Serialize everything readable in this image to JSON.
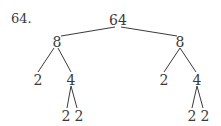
{
  "problem_label": "64.",
  "tree": {
    "root": "64",
    "level1": [
      "8",
      "8"
    ],
    "level2": [
      "2",
      "4",
      "2",
      "4"
    ],
    "level3": [
      "2",
      "2",
      "2",
      "2"
    ]
  },
  "colors": {
    "ink": "#3a3a3a",
    "background": "#ffffff"
  }
}
